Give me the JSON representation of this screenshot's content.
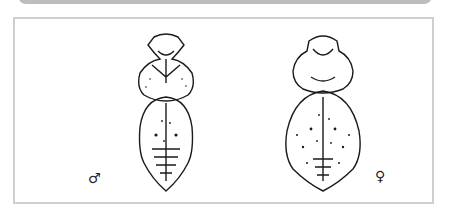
{
  "figure": {
    "panels": [
      {
        "id": "male",
        "symbol": "♂",
        "label": "male specimen dorsal view"
      },
      {
        "id": "female",
        "symbol": "♀",
        "label": "female specimen dorsal view"
      }
    ]
  }
}
